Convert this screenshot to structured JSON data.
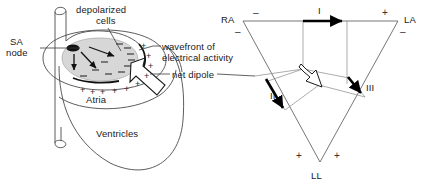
{
  "figure": {
    "background_color": "#ffffff",
    "line_color": "#4a4a4a",
    "ink_color": "#1a1a1a",
    "shade_color": "#d4d4d4"
  },
  "heart_diagram": {
    "labels": {
      "sa_node_line1": "SA",
      "sa_node_line2": "node",
      "depolarized_line1": "depolarized",
      "depolarized_line2": "cells",
      "wavefront_line1": "wavefront of",
      "wavefront_line2": "electrical activity",
      "net_dipole": "net dipole",
      "atria": "Atria",
      "ventricles": "Ventricles"
    },
    "charges": {
      "negative_symbol": "–",
      "positive_symbol": "+",
      "negative_count": 10,
      "positive_count": 10
    },
    "icons": {
      "sa_node": "sa-node-dot",
      "conduction_arrows": "conduction-arrow",
      "net_dipole_arrow": "hollow-arrow"
    }
  },
  "einthoven_triangle": {
    "vertices": [
      {
        "id": "RA",
        "label": "RA",
        "x": 243,
        "y": 21
      },
      {
        "id": "LA",
        "label": "LA",
        "x": 398,
        "y": 21
      },
      {
        "id": "LL",
        "label": "LL",
        "x": 320,
        "y": 162
      }
    ],
    "leads": [
      {
        "id": "I",
        "label": "I",
        "polarity_left": "–",
        "polarity_right": "+"
      },
      {
        "id": "II",
        "label": "II",
        "polarity_top": "–",
        "polarity_bottom": "+"
      },
      {
        "id": "III",
        "label": "III",
        "polarity_top": "–",
        "polarity_bottom": "+"
      }
    ],
    "polarity_marks": {
      "ra_top": "–",
      "ra_lower": "–",
      "la_top": "+",
      "la_lower": "–",
      "ll_left": "+",
      "ll_right": "+"
    },
    "net_dipole_label": "net dipole"
  }
}
